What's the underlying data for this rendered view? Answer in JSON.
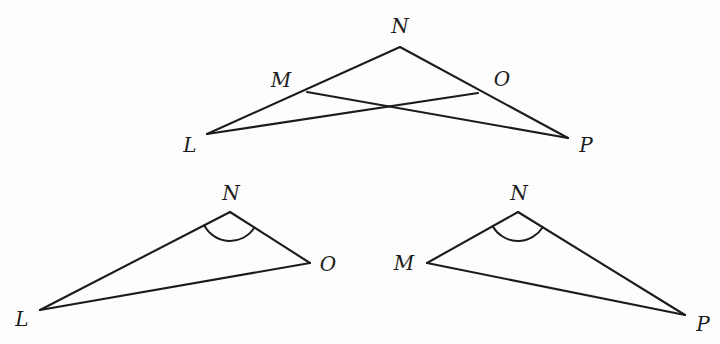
{
  "figure": {
    "background_color": "#fdfdfd",
    "stroke_color": "#1b1b1b",
    "diagrams": [
      {
        "id": "combined",
        "name": "overlapping-triangles",
        "points": {
          "N": {
            "x": 400,
            "y": 47
          },
          "M": {
            "x": 307,
            "y": 92
          },
          "O": {
            "x": 478,
            "y": 93
          },
          "L": {
            "x": 207,
            "y": 134
          },
          "P": {
            "x": 568,
            "y": 138
          }
        },
        "labels": [
          {
            "key": "N",
            "text": "N",
            "x": 400,
            "y": 27
          },
          {
            "key": "M",
            "text": "M",
            "x": 281,
            "y": 81
          },
          {
            "key": "O",
            "text": "O",
            "x": 502,
            "y": 80
          },
          {
            "key": "L",
            "text": "L",
            "x": 190,
            "y": 146
          },
          {
            "key": "P",
            "text": "P",
            "x": 586,
            "y": 146
          }
        ],
        "segments": [
          {
            "name": "segment-L-N",
            "from": "L",
            "to": "N"
          },
          {
            "name": "segment-N-P",
            "from": "N",
            "to": "P"
          },
          {
            "name": "segment-L-O",
            "from": "L",
            "to": "O"
          },
          {
            "name": "segment-M-P",
            "from": "M",
            "to": "P"
          }
        ],
        "arcs": []
      },
      {
        "id": "triangle-lno",
        "name": "triangle-L-N-O",
        "points": {
          "N": {
            "x": 230,
            "y": 212
          },
          "O": {
            "x": 310,
            "y": 263
          },
          "L": {
            "x": 40,
            "y": 310
          }
        },
        "labels": [
          {
            "key": "N",
            "text": "N",
            "x": 231,
            "y": 194
          },
          {
            "key": "O",
            "text": "O",
            "x": 328,
            "y": 265
          },
          {
            "key": "L",
            "text": "L",
            "x": 22,
            "y": 320
          }
        ],
        "segments": [
          {
            "name": "segment-L-N",
            "from": "L",
            "to": "N"
          },
          {
            "name": "segment-N-O",
            "from": "N",
            "to": "O"
          },
          {
            "name": "segment-L-O",
            "from": "L",
            "to": "O"
          }
        ],
        "arcs": [
          {
            "name": "angle-arc-N",
            "vertex": "N",
            "radius": 29
          }
        ]
      },
      {
        "id": "triangle-mnp",
        "name": "triangle-M-N-P",
        "points": {
          "N": {
            "x": 518,
            "y": 212
          },
          "M": {
            "x": 427,
            "y": 263
          },
          "P": {
            "x": 685,
            "y": 315
          }
        },
        "labels": [
          {
            "key": "N",
            "text": "N",
            "x": 519,
            "y": 194
          },
          {
            "key": "M",
            "text": "M",
            "x": 404,
            "y": 264
          },
          {
            "key": "P",
            "text": "P",
            "x": 703,
            "y": 325
          }
        ],
        "segments": [
          {
            "name": "segment-M-N",
            "from": "M",
            "to": "N"
          },
          {
            "name": "segment-N-P",
            "from": "N",
            "to": "P"
          },
          {
            "name": "segment-M-P",
            "from": "M",
            "to": "P"
          }
        ],
        "arcs": [
          {
            "name": "angle-arc-N",
            "vertex": "N",
            "radius": 29
          }
        ]
      }
    ]
  }
}
